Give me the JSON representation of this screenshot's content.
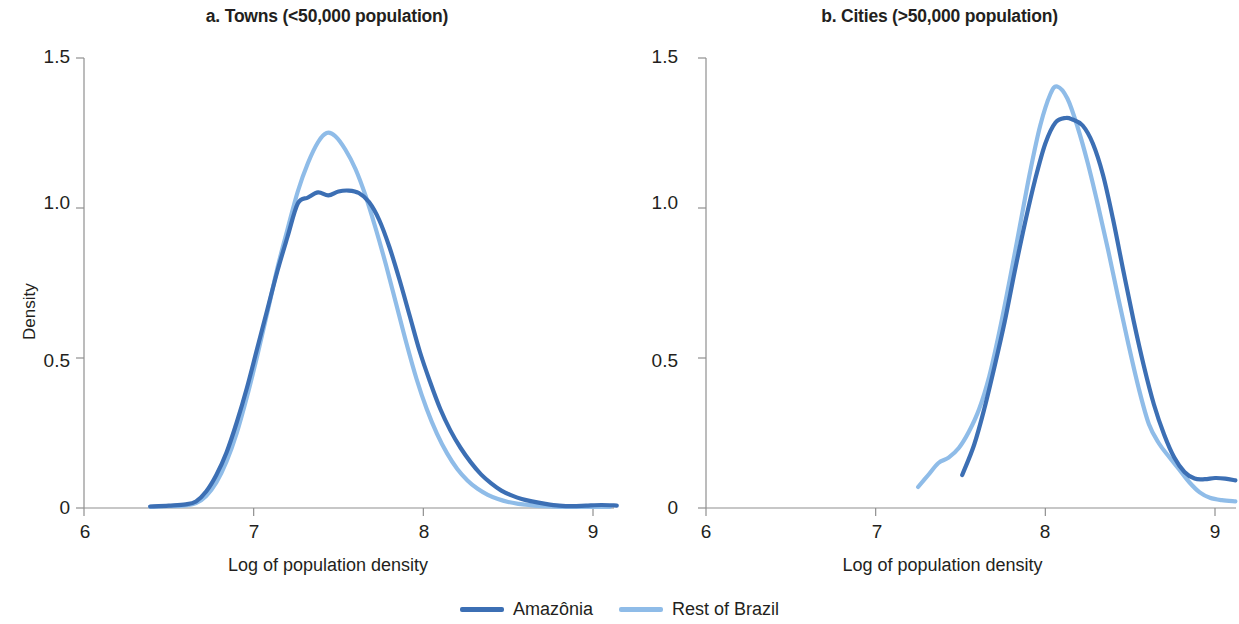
{
  "figure": {
    "background": "#ffffff",
    "series_colors": {
      "amazonia": "#3C6FB4",
      "rest_of_brazil": "#8FBCE8"
    },
    "axis_color": "#8f8f8f"
  },
  "legend": {
    "items": [
      {
        "label": "Amazônia",
        "color": "#3C6FB4",
        "swatch_icon": "line-swatch-icon"
      },
      {
        "label": "Rest of Brazil",
        "color": "#8FBCE8",
        "swatch_icon": "line-swatch-icon"
      }
    ]
  },
  "panels": {
    "a": {
      "title": "a. Towns (<50,000 population)",
      "xlabel": "Log of population density",
      "ylabel": "Density",
      "xticks": [
        "6",
        "7",
        "8",
        "9"
      ],
      "yticks": [
        "1.5",
        "1.0",
        "0.5",
        "0"
      ]
    },
    "b": {
      "title": "b. Cities (>50,000 population)",
      "xlabel": "Log of population density",
      "ylabel": "Density",
      "xticks": [
        "6",
        "7",
        "8",
        "9"
      ],
      "yticks": [
        "1.5",
        "1.0",
        "0.5",
        "0"
      ]
    }
  },
  "chart_data": [
    {
      "type": "line",
      "panel": "a",
      "title": "a. Towns (<50,000 population)",
      "xlabel": "Log of population density",
      "ylabel": "Density",
      "xlim": [
        6,
        9.15
      ],
      "ylim": [
        0,
        1.5
      ],
      "xticks": [
        6,
        7,
        8,
        9
      ],
      "yticks": [
        0,
        0.5,
        1.0,
        1.5
      ],
      "grid": false,
      "legend_position": "bottom-center-shared",
      "series": [
        {
          "name": "Amazônia",
          "color": "#3C6FB4",
          "x": [
            6.39,
            6.5,
            6.6,
            6.66,
            6.72,
            6.78,
            6.84,
            6.9,
            6.96,
            7.02,
            7.08,
            7.14,
            7.2,
            7.26,
            7.32,
            7.38,
            7.44,
            7.5,
            7.56,
            7.62,
            7.68,
            7.74,
            7.8,
            7.86,
            7.92,
            7.98,
            8.04,
            8.1,
            8.16,
            8.22,
            8.28,
            8.34,
            8.4,
            8.46,
            8.52,
            8.58,
            8.64,
            8.72,
            8.8,
            8.88,
            8.96,
            9.05,
            9.14
          ],
          "y": [
            0.005,
            0.008,
            0.012,
            0.022,
            0.055,
            0.11,
            0.185,
            0.285,
            0.4,
            0.53,
            0.66,
            0.79,
            0.905,
            1.015,
            1.035,
            1.052,
            1.042,
            1.055,
            1.058,
            1.05,
            1.02,
            0.96,
            0.87,
            0.76,
            0.64,
            0.52,
            0.42,
            0.33,
            0.258,
            0.2,
            0.152,
            0.112,
            0.082,
            0.058,
            0.042,
            0.03,
            0.022,
            0.014,
            0.008,
            0.006,
            0.008,
            0.01,
            0.008
          ]
        },
        {
          "name": "Rest of Brazil",
          "color": "#8FBCE8",
          "x": [
            6.39,
            6.5,
            6.6,
            6.66,
            6.72,
            6.78,
            6.84,
            6.9,
            6.96,
            7.02,
            7.08,
            7.14,
            7.2,
            7.26,
            7.32,
            7.38,
            7.43,
            7.48,
            7.54,
            7.6,
            7.66,
            7.72,
            7.78,
            7.84,
            7.9,
            7.96,
            8.02,
            8.08,
            8.14,
            8.2,
            8.26,
            8.32,
            8.38,
            8.44,
            8.5,
            8.56,
            8.62,
            8.7,
            8.8,
            8.9,
            9.0,
            9.1
          ],
          "y": [
            0.004,
            0.006,
            0.009,
            0.016,
            0.04,
            0.085,
            0.155,
            0.25,
            0.37,
            0.505,
            0.65,
            0.8,
            0.93,
            1.055,
            1.15,
            1.22,
            1.25,
            1.24,
            1.195,
            1.13,
            1.04,
            0.93,
            0.81,
            0.68,
            0.55,
            0.43,
            0.33,
            0.248,
            0.182,
            0.13,
            0.092,
            0.064,
            0.044,
            0.03,
            0.02,
            0.014,
            0.01,
            0.006,
            0.004,
            0.004,
            0.004,
            0.004
          ]
        }
      ]
    },
    {
      "type": "line",
      "panel": "b",
      "title": "b. Cities (>50,000 population)",
      "xlabel": "Log of population density",
      "ylabel": "Density",
      "xlim": [
        6,
        9.15
      ],
      "ylim": [
        0,
        1.5
      ],
      "xticks": [
        6,
        7,
        8,
        9
      ],
      "yticks": [
        0,
        0.5,
        1.0,
        1.5
      ],
      "grid": false,
      "legend_position": "bottom-center-shared",
      "series": [
        {
          "name": "Amazônia",
          "color": "#3C6FB4",
          "x": [
            7.51,
            7.58,
            7.64,
            7.7,
            7.76,
            7.82,
            7.88,
            7.94,
            8.0,
            8.06,
            8.12,
            8.16,
            8.22,
            8.28,
            8.34,
            8.4,
            8.46,
            8.52,
            8.58,
            8.64,
            8.7,
            8.76,
            8.82,
            8.88,
            8.94,
            9.0,
            9.06,
            9.12
          ],
          "y": [
            0.11,
            0.21,
            0.33,
            0.47,
            0.62,
            0.79,
            0.95,
            1.095,
            1.215,
            1.285,
            1.3,
            1.295,
            1.275,
            1.215,
            1.11,
            0.96,
            0.79,
            0.625,
            0.475,
            0.345,
            0.245,
            0.168,
            0.12,
            0.098,
            0.096,
            0.1,
            0.098,
            0.092
          ]
        },
        {
          "name": "Rest of Brazil",
          "color": "#8FBCE8",
          "x": [
            7.25,
            7.31,
            7.37,
            7.43,
            7.49,
            7.55,
            7.61,
            7.67,
            7.73,
            7.79,
            7.85,
            7.91,
            7.97,
            8.03,
            8.07,
            8.13,
            8.19,
            8.25,
            8.31,
            8.37,
            8.43,
            8.49,
            8.55,
            8.61,
            8.67,
            8.73,
            8.79,
            8.85,
            8.91,
            8.97,
            9.04,
            9.12
          ],
          "y": [
            0.07,
            0.11,
            0.15,
            0.168,
            0.2,
            0.255,
            0.33,
            0.44,
            0.59,
            0.76,
            0.94,
            1.12,
            1.275,
            1.38,
            1.405,
            1.365,
            1.27,
            1.15,
            1.01,
            0.86,
            0.7,
            0.545,
            0.4,
            0.28,
            0.215,
            0.17,
            0.128,
            0.085,
            0.052,
            0.034,
            0.026,
            0.022
          ]
        }
      ]
    }
  ]
}
